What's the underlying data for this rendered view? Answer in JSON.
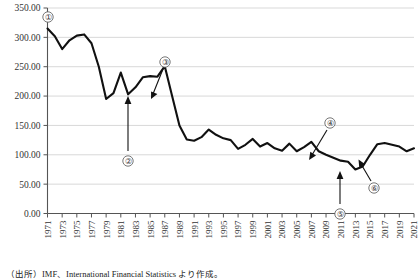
{
  "chart_data": {
    "type": "line",
    "title": "",
    "xlabel": "",
    "ylabel": "",
    "ylim": [
      0,
      350
    ],
    "yticks": [
      0,
      50,
      100,
      150,
      200,
      250,
      300,
      350
    ],
    "ytick_labels": [
      "0.00",
      "50.00",
      "100.00",
      "150.00",
      "200.00",
      "250.00",
      "300.00",
      "350.00"
    ],
    "grid": true,
    "legend": "none",
    "xlim": [
      1971,
      2021
    ],
    "xtick_labels": [
      "1971",
      "1973",
      "1975",
      "1977",
      "1979",
      "1981",
      "1983",
      "1985",
      "1987",
      "1989",
      "1991",
      "1993",
      "1995",
      "1997",
      "1999",
      "2001",
      "2003",
      "2005",
      "2007",
      "2009",
      "2011",
      "2013",
      "2015",
      "2017",
      "2019",
      "2021"
    ],
    "x": [
      1971,
      1972,
      1973,
      1974,
      1975,
      1976,
      1977,
      1978,
      1979,
      1980,
      1981,
      1982,
      1983,
      1984,
      1985,
      1986,
      1987,
      1988,
      1989,
      1990,
      1991,
      1992,
      1993,
      1994,
      1995,
      1996,
      1997,
      1998,
      1999,
      2000,
      2001,
      2002,
      2003,
      2004,
      2005,
      2006,
      2007,
      2008,
      2009,
      2010,
      2011,
      2012,
      2013,
      2014,
      2015,
      2016,
      2017,
      2018,
      2019,
      2020,
      2021
    ],
    "values": [
      315.0,
      302.0,
      280.0,
      295.0,
      303.0,
      305.0,
      290.0,
      250.0,
      195.0,
      205.0,
      240.0,
      203.0,
      215.0,
      232.0,
      234.0,
      233.0,
      251.0,
      200.0,
      150.0,
      126.0,
      124.0,
      130.0,
      143.0,
      134.0,
      128.0,
      125.0,
      110.0,
      117.0,
      127.0,
      114.0,
      120.0,
      111.0,
      107.0,
      119.0,
      106.0,
      113.0,
      122.0,
      106.0,
      100.0,
      95.0,
      90.0,
      88.0,
      75.0,
      80.0,
      100.0,
      118.0,
      120.0,
      117.0,
      114.0,
      106.0,
      111.0
    ],
    "annotations": [
      {
        "id": "1",
        "label": "①",
        "year": 1971,
        "note": "marker-1"
      },
      {
        "id": "2",
        "label": "②",
        "year": 1983,
        "note": "marker-2"
      },
      {
        "id": "3",
        "label": "③",
        "year": 1988,
        "note": "marker-3"
      },
      {
        "id": "4",
        "label": "④",
        "year": 2008,
        "note": "marker-4"
      },
      {
        "id": "5",
        "label": "⑤",
        "year": 2013,
        "note": "marker-5"
      },
      {
        "id": "6",
        "label": "⑥",
        "year": 2015,
        "note": "marker-6"
      }
    ]
  },
  "source": {
    "text": "（出所）IMF、International Financial Statistics より作成。"
  },
  "colors": {
    "series": "#111111",
    "grid": "#d9d9d9",
    "axis": "#555555",
    "text": "#222222",
    "background": "#ffffff"
  }
}
